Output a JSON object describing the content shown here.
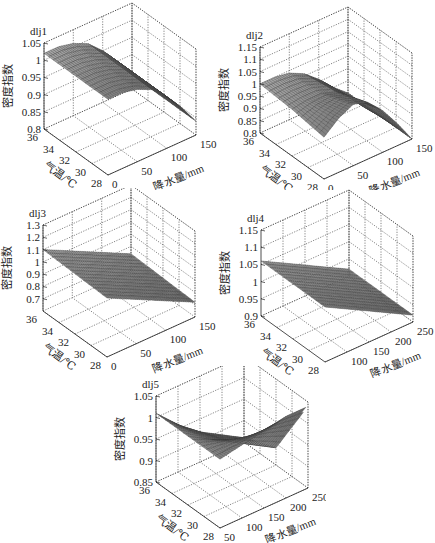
{
  "figure": {
    "y_label": "密度指数",
    "x_label": "降水量/mm",
    "t_label": "气温/℃"
  },
  "chart_data": [
    {
      "type": "surface3d",
      "title": "dlj1",
      "xlabel": "降水量/mm",
      "ylabel": "气温/℃",
      "zlabel": "密度指数",
      "x_ticks": [
        0,
        50,
        100,
        150
      ],
      "xlim": [
        0,
        150
      ],
      "y_ticks": [
        28,
        30,
        32,
        34,
        36
      ],
      "ylim": [
        28,
        36
      ],
      "z_ticks": [
        0.8,
        0.85,
        0.9,
        0.95,
        1,
        1.05
      ],
      "zlim": [
        0.8,
        1.05
      ],
      "grid": true,
      "description": "Surface near 1.02 at low precipitation, curving down to ~0.84 at high precipitation; weakly dependent on temperature.",
      "x": [
        0,
        25,
        50,
        75,
        100,
        125,
        150
      ],
      "y": [
        28,
        32,
        36
      ],
      "z": [
        [
          1.02,
          1.02,
          1.01,
          0.99,
          0.95,
          0.9,
          0.84
        ],
        [
          1.02,
          1.02,
          1.01,
          0.99,
          0.95,
          0.9,
          0.84
        ],
        [
          1.02,
          1.02,
          1.01,
          0.99,
          0.95,
          0.9,
          0.84
        ]
      ]
    },
    {
      "type": "surface3d",
      "title": "dlj2",
      "xlabel": "降水量/mm",
      "ylabel": "气温/℃",
      "zlabel": "密度指数",
      "x_ticks": [
        0,
        50,
        100,
        150
      ],
      "xlim": [
        0,
        150
      ],
      "y_ticks": [
        28,
        30,
        32,
        34,
        36
      ],
      "ylim": [
        28,
        36
      ],
      "z_ticks": [
        0.8,
        0.85,
        0.9,
        0.95,
        1,
        1.05,
        1.1,
        1.15
      ],
      "zlim": [
        0.8,
        1.15
      ],
      "grid": true,
      "description": "Saddle-like surface: ~1.0 at high temperature, dips at mid, rises to ~1.05 at low temperature/mid precipitation, falls to ~0.8 at high precipitation.",
      "x": [
        0,
        25,
        50,
        75,
        100,
        125,
        150
      ],
      "y": [
        28,
        32,
        36
      ],
      "z": [
        [
          0.97,
          1.02,
          1.05,
          1.03,
          0.97,
          0.89,
          0.8
        ],
        [
          0.99,
          1.0,
          1.0,
          0.98,
          0.93,
          0.86,
          0.8
        ],
        [
          1.0,
          1.0,
          0.99,
          0.96,
          0.91,
          0.85,
          0.8
        ]
      ]
    },
    {
      "type": "surface3d",
      "title": "dlj3",
      "xlabel": "降水量/mm",
      "ylabel": "气温/℃",
      "zlabel": "密度指数",
      "x_ticks": [
        0,
        50,
        100,
        150
      ],
      "xlim": [
        0,
        150
      ],
      "y_ticks": [
        28,
        30,
        32,
        34,
        36
      ],
      "ylim": [
        28,
        36
      ],
      "z_ticks": [
        0.7,
        0.8,
        0.9,
        1,
        1.1,
        1.2,
        1.3
      ],
      "zlim": [
        0.6,
        1.3
      ],
      "grid": true,
      "description": "Nearly planar surface decreasing from ~1.1 at low precipitation to ~0.7 at high precipitation.",
      "x": [
        0,
        25,
        50,
        75,
        100,
        125,
        150
      ],
      "y": [
        28,
        32,
        36
      ],
      "z": [
        [
          1.08,
          1.02,
          0.96,
          0.9,
          0.84,
          0.78,
          0.72
        ],
        [
          1.09,
          1.03,
          0.97,
          0.91,
          0.85,
          0.79,
          0.73
        ],
        [
          1.1,
          1.04,
          0.98,
          0.92,
          0.86,
          0.8,
          0.74
        ]
      ]
    },
    {
      "type": "surface3d",
      "title": "dlj4",
      "xlabel": "降水量/mm",
      "ylabel": "气温/℃",
      "zlabel": "密度指数",
      "x_ticks": [
        100,
        150,
        200,
        250
      ],
      "xlim": [
        50,
        250
      ],
      "y_ticks": [
        28,
        30,
        32,
        34,
        36
      ],
      "ylim": [
        28,
        36
      ],
      "z_ticks": [
        0.9,
        0.95,
        1,
        1.05,
        1.1,
        1.15
      ],
      "zlim": [
        0.9,
        1.15
      ],
      "grid": true,
      "description": "Planar surface decreasing from ~1.06 at low precipitation to ~0.92 at high precipitation.",
      "x": [
        50,
        100,
        150,
        200,
        250
      ],
      "y": [
        28,
        32,
        36
      ],
      "z": [
        [
          1.06,
          1.025,
          0.99,
          0.955,
          0.92
        ],
        [
          1.06,
          1.025,
          0.99,
          0.955,
          0.92
        ],
        [
          1.06,
          1.025,
          0.99,
          0.955,
          0.92
        ]
      ]
    },
    {
      "type": "surface3d",
      "title": "dlj5",
      "xlabel": "降水量/mm",
      "ylabel": "气温/℃",
      "zlabel": "密度指数",
      "x_ticks": [
        50,
        100,
        150,
        200,
        250
      ],
      "xlim": [
        50,
        250
      ],
      "y_ticks": [
        28,
        30,
        32,
        34,
        36
      ],
      "ylim": [
        28,
        36
      ],
      "z_ticks": [
        0.85,
        0.9,
        0.95,
        1,
        1.05
      ],
      "zlim": [
        0.85,
        1.05
      ],
      "grid": true,
      "description": "Surface ~1.0 at low precipitation, decreasing toward ~0.86 at high precipitation and low temperature; triangular domain.",
      "x": [
        50,
        100,
        150,
        200,
        250
      ],
      "y": [
        28,
        32,
        36
      ],
      "z": [
        [
          1.01,
          1.02,
          1.03,
          1.04,
          1.04
        ],
        [
          1.01,
          0.98,
          0.95,
          0.92,
          0.89
        ],
        [
          1.01,
          0.96,
          0.92,
          0.89,
          0.86
        ]
      ]
    }
  ],
  "panels": [
    {
      "title": "dlj1",
      "x": 0,
      "y": 0,
      "ox": 44,
      "oy": 43
    },
    {
      "title": "dlj2",
      "x": 216,
      "y": 0,
      "ox": 44,
      "oy": 47
    },
    {
      "title": "dlj3",
      "x": 0,
      "y": 188,
      "ox": 43,
      "oy": 37
    },
    {
      "title": "dlj4",
      "x": 216,
      "y": 188,
      "ox": 45,
      "oy": 42
    },
    {
      "title": "dlj5",
      "x": 108,
      "y": 366,
      "ox": 48,
      "oy": 30
    }
  ]
}
